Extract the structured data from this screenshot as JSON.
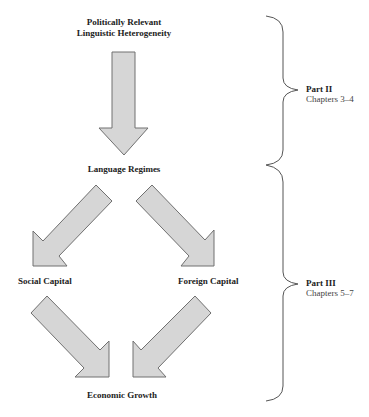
{
  "diagram": {
    "nodes": {
      "top": {
        "line1": "Politically Relevant",
        "line2": "Linguistic Heterogeneity"
      },
      "middle": {
        "label": "Language Regimes"
      },
      "left": {
        "label": "Social Capital"
      },
      "right": {
        "label": "Foreign Capital"
      },
      "bottom": {
        "label": "Economic Growth"
      }
    },
    "parts": [
      {
        "title": "Part II",
        "chapters": "Chapters 3–4"
      },
      {
        "title": "Part III",
        "chapters": "Chapters 5–7"
      }
    ],
    "edges": [
      {
        "from": "Politically Relevant Linguistic Heterogeneity",
        "to": "Language Regimes"
      },
      {
        "from": "Language Regimes",
        "to": "Social Capital"
      },
      {
        "from": "Language Regimes",
        "to": "Foreign Capital"
      },
      {
        "from": "Social Capital",
        "to": "Economic Growth"
      },
      {
        "from": "Foreign Capital",
        "to": "Economic Growth"
      }
    ],
    "colors": {
      "arrow_fill": "#d6d6d6",
      "arrow_stroke": "#707070",
      "brace_stroke": "#555555"
    }
  }
}
